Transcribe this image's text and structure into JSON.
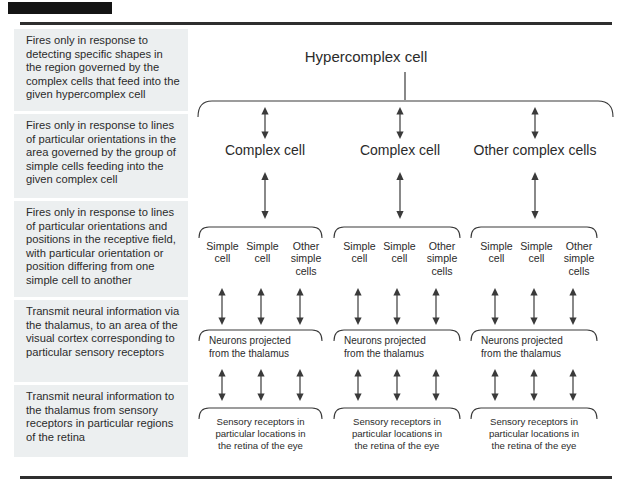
{
  "figure": {
    "marker_bar": "black-marker-bar",
    "title_rule_top": "top-divider",
    "title_rule_bottom": "bottom-divider"
  },
  "descriptions": [
    {
      "id": "hypercomplex-description",
      "text": "Fires only in response to detecting specific shapes in the region governed by the complex cells that feed into the given hypercomplex cell"
    },
    {
      "id": "complex-description",
      "text": "Fires only in response to lines of particular orientations in the area governed by the group of simple cells feeding into the given complex cell"
    },
    {
      "id": "simple-description",
      "text": "Fires only in response to lines of particular orientations and positions in the receptive field, with particular orientation or position differing from one simple cell to another"
    },
    {
      "id": "thalamus-description",
      "text": "Transmit neural information via the thalamus, to an area of the visual cortex corresponding to particular sensory receptors"
    },
    {
      "id": "retina-description",
      "text": "Transmit neural information to the thalamus from sensory receptors in particular regions of the retina"
    }
  ],
  "diagram": {
    "root": {
      "label": "Hypercomplex cell"
    },
    "complex_level": [
      {
        "label": "Complex cell"
      },
      {
        "label": "Complex cell"
      },
      {
        "label": "Other complex cells"
      }
    ],
    "simple_level": [
      {
        "cells": [
          {
            "line1": "Simple",
            "line2": "cell"
          },
          {
            "line1": "Simple",
            "line2": "cell"
          },
          {
            "line1": "Other",
            "line2": "simple",
            "line3": "cells"
          }
        ]
      },
      {
        "cells": [
          {
            "line1": "Simple",
            "line2": "cell"
          },
          {
            "line1": "Simple",
            "line2": "cell"
          },
          {
            "line1": "Other",
            "line2": "simple",
            "line3": "cells"
          }
        ]
      },
      {
        "cells": [
          {
            "line1": "Simple",
            "line2": "cell"
          },
          {
            "line1": "Simple",
            "line2": "cell"
          },
          {
            "line1": "Other",
            "line2": "simple",
            "line3": "cells"
          }
        ]
      }
    ],
    "thalamus_level": [
      {
        "line1": "Neurons projected",
        "line2": "from the thalamus"
      },
      {
        "line1": "Neurons projected",
        "line2": "from the thalamus"
      },
      {
        "line1": "Neurons projected",
        "line2": "from the thalamus"
      }
    ],
    "receptor_level": [
      {
        "line1": "Sensory receptors in",
        "line2": "particular locations in",
        "line3": "the retina of the eye"
      },
      {
        "line1": "Sensory receptors in",
        "line2": "particular locations in",
        "line3": "the retina of the eye"
      },
      {
        "line1": "Sensory receptors in",
        "line2": "particular locations in",
        "line3": "the retina of the eye"
      }
    ]
  },
  "colors": {
    "description_background": "#eceff0",
    "ink": "#2b2b2b",
    "line": "#3a3a3a",
    "marker": "#141414",
    "page": "#ffffff"
  }
}
